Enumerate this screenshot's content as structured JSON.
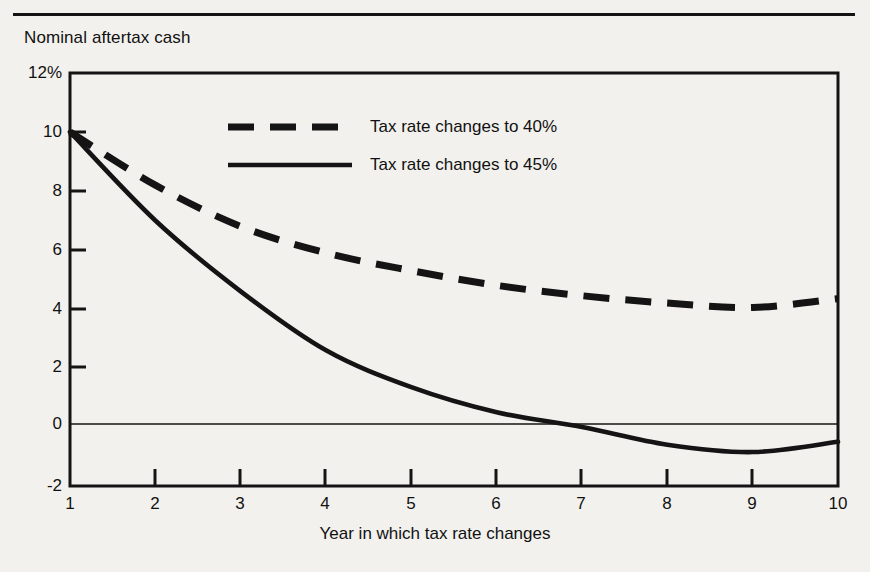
{
  "figure": {
    "background_color": "#f3f1ee",
    "ink_color": "#141414",
    "top_rule": true
  },
  "chart_data": {
    "type": "line",
    "title": "",
    "subtitle": "",
    "ylabel": "Nominal aftertax cash",
    "xlabel": "Year in which tax rate changes",
    "x": [
      1,
      2,
      3,
      4,
      5,
      6,
      7,
      8,
      9,
      10
    ],
    "xticklabels": [
      "1",
      "2",
      "3",
      "4",
      "5",
      "6",
      "7",
      "8",
      "9",
      "10"
    ],
    "yticks": [
      -2,
      0,
      2,
      4,
      6,
      8,
      10,
      12
    ],
    "yticklabels": [
      "-2",
      "0",
      "2",
      "4",
      "6",
      "8",
      "10",
      "12%"
    ],
    "xlim": [
      1,
      10
    ],
    "ylim": [
      -2,
      12
    ],
    "grid": false,
    "zero_line": true,
    "legend_position": "upper-center-inside",
    "series": [
      {
        "name": "Tax rate changes to 40%",
        "style": "dashed",
        "values": [
          10.0,
          8.2,
          6.8,
          5.9,
          5.3,
          4.8,
          4.45,
          4.2,
          4.05,
          4.35
        ]
      },
      {
        "name": "Tax rate changes to 45%",
        "style": "solid",
        "values": [
          10.0,
          7.0,
          4.6,
          2.6,
          1.35,
          0.5,
          0.0,
          -0.6,
          -0.85,
          -0.5
        ]
      }
    ]
  },
  "legend": {
    "items": [
      {
        "label": "Tax rate changes to 40%",
        "style": "dashed"
      },
      {
        "label": "Tax rate changes to 45%",
        "style": "solid"
      }
    ]
  }
}
